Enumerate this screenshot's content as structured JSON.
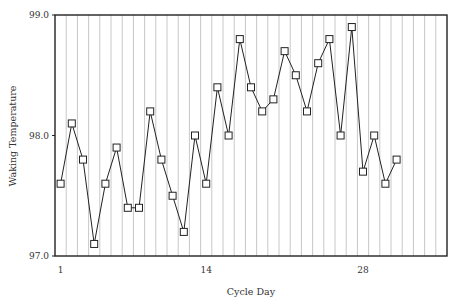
{
  "chart_data": {
    "type": "line",
    "title": "",
    "xlabel": "Cycle Day",
    "ylabel": "Waking Temperature",
    "xlim": [
      0.5,
      35.5
    ],
    "ylim": [
      97.0,
      99.0
    ],
    "x_ticks": [
      1,
      14,
      28
    ],
    "y_ticks": [
      "97.0",
      "98.0",
      "99.0"
    ],
    "grid": "vertical lines between each day",
    "legend": null,
    "marker": "open-square",
    "series": [
      {
        "name": "Waking Temperature",
        "x": [
          1,
          2,
          3,
          4,
          5,
          6,
          7,
          8,
          9,
          10,
          11,
          12,
          13,
          14,
          15,
          16,
          17,
          18,
          19,
          20,
          21,
          22,
          23,
          24,
          25,
          26,
          27,
          28,
          29,
          30,
          31
        ],
        "values": [
          97.6,
          98.1,
          97.8,
          97.1,
          97.6,
          97.9,
          97.4,
          97.4,
          98.2,
          97.8,
          97.5,
          97.2,
          98.0,
          97.6,
          98.4,
          98.0,
          98.8,
          98.4,
          98.2,
          98.3,
          98.7,
          98.5,
          98.2,
          98.6,
          98.8,
          98.0,
          98.9,
          97.7,
          98.0,
          97.6,
          97.8
        ]
      }
    ]
  },
  "colors": {
    "line": "#222222",
    "marker_fill": "#ffffff",
    "grid": "#c8c8c8",
    "axis": "#222222"
  }
}
